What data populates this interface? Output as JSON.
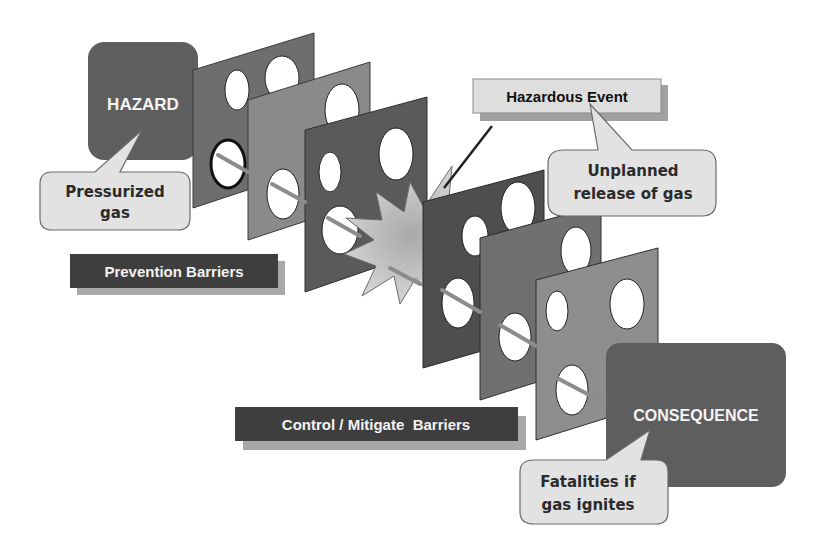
{
  "diagram": {
    "type": "swiss-cheese-bowtie",
    "hazard": {
      "label": "HAZARD",
      "callout": [
        "Pressurized",
        "gas"
      ]
    },
    "hazardous_event": {
      "label": "Hazardous Event",
      "callout": [
        "Unplanned",
        "release of gas"
      ]
    },
    "consequence": {
      "label": "CONSEQUENCE",
      "callout": [
        "Fatalities if",
        "gas ignites"
      ]
    },
    "barrier_groups": [
      {
        "label": "Prevention Barriers",
        "count": 3
      },
      {
        "label": "Control / Mitigate  Barriers",
        "count": 3
      }
    ],
    "colors": {
      "box_dark": "#5e5e5e",
      "plate_1": "#6e6e6e",
      "plate_2": "#8a8a8a",
      "plate_3": "#5a5a5a",
      "plate_4": "#4e4e4e",
      "plate_5": "#707070",
      "plate_6": "#8e8e8e",
      "callout_fill": "#e2e2e2",
      "banner_fill": "#3e3e3e",
      "banner_shadow": "#a8a8a8",
      "arrow": "#8c8c8c",
      "burst": "#c8c8c8"
    }
  }
}
